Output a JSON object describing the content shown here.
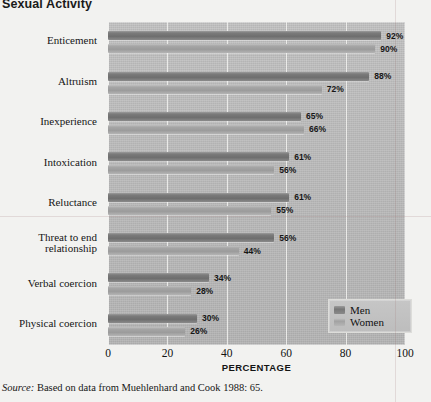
{
  "chart_data": {
    "type": "bar",
    "orientation": "horizontal",
    "title": "Sexual Activity",
    "xlabel": "PERCENTAGE",
    "ylabel": "",
    "xlim": [
      0,
      100
    ],
    "xticks": [
      "0",
      "20",
      "40",
      "60",
      "80",
      "100"
    ],
    "grid": true,
    "legend_position": "bottom-right",
    "categories": [
      "Enticement",
      "Altruism",
      "Inexperience",
      "Intoxication",
      "Reluctance",
      "Threat to end relationship",
      "Verbal coercion",
      "Physical coercion"
    ],
    "series": [
      {
        "name": "Men",
        "color": "#767676",
        "values": [
          92,
          88,
          65,
          61,
          61,
          56,
          34,
          30
        ],
        "labels": [
          "92%",
          "88%",
          "65%",
          "61%",
          "61%",
          "56%",
          "34%",
          "30%"
        ]
      },
      {
        "name": "Women",
        "color": "#a5a5a5",
        "values": [
          90,
          72,
          66,
          56,
          55,
          44,
          28,
          26
        ],
        "labels": [
          "90%",
          "72%",
          "66%",
          "56%",
          "55%",
          "44%",
          "28%",
          "26%"
        ]
      }
    ]
  },
  "legend": {
    "items": [
      {
        "label": "Men",
        "swatch": "men"
      },
      {
        "label": "Women",
        "swatch": "women"
      }
    ]
  },
  "source": {
    "prefix": "Source:",
    "text": " Based on data from Muehlenhard and Cook 1988: 65."
  },
  "colors": {
    "page_background": "#f2f2f0",
    "plot_background": "#bcbcbc",
    "men_bar": "#767676",
    "women_bar": "#a5a5a5",
    "gridline": "#f2f2f0",
    "text": "#121212"
  }
}
